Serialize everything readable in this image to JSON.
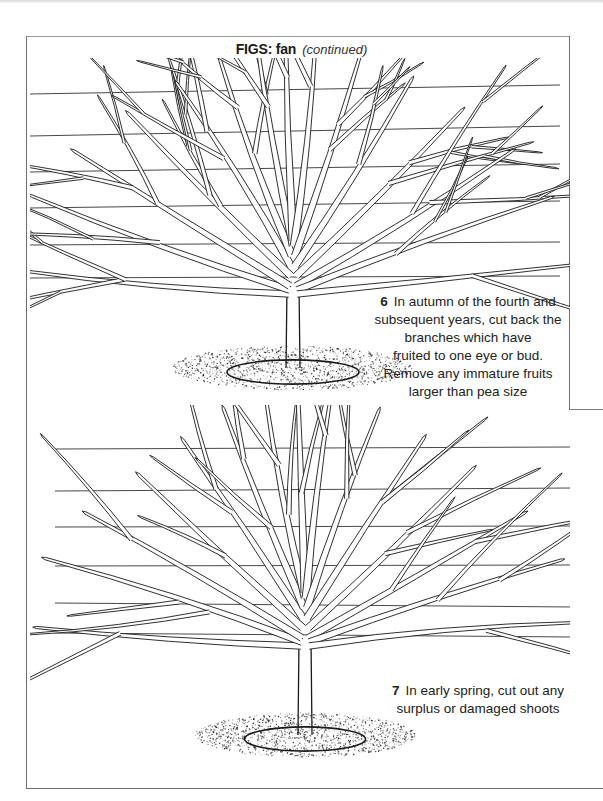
{
  "page": {
    "title": "FIGS: fan",
    "title_suffix": "(continued)"
  },
  "figures": [
    {
      "step": "6",
      "caption": "In autumn of the fourth and subsequent years, cut back the branches which have fruited to one eye or bud. Remove any immature fruits larger than pea size",
      "caption_lines": [
        "In autumn of the fourth and",
        "subsequent years, cut back the",
        "branches which have",
        "fruited to one eye or bud.",
        "Remove any immature fruits",
        "larger than pea size"
      ],
      "illustration": "fan-trained fig tree on horizontal training wires with fruited branches cut back"
    },
    {
      "step": "7",
      "caption": "In early spring, cut out any surplus or damaged shoots",
      "caption_lines": [
        "In early spring, cut out any",
        "surplus or damaged shoots"
      ],
      "illustration": "fan-trained fig tree on horizontal training wires after spring pruning"
    }
  ],
  "colors": {
    "ink": "#1a1a1a",
    "frame": "#6e6e6e",
    "paper": "#ffffff"
  }
}
